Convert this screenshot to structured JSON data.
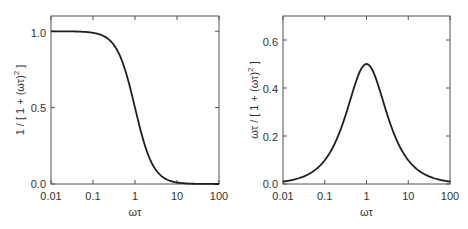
{
  "chart_data": [
    {
      "type": "line",
      "title": "",
      "xlabel": "ωτ",
      "ylabel": "1 / [ 1 + (ωτ)² ]",
      "xscale": "log",
      "xlim": [
        0.01,
        100
      ],
      "ylim": [
        0,
        1.1
      ],
      "xticks": [
        0.01,
        0.1,
        1,
        10,
        100
      ],
      "xtick_labels": [
        "0.01",
        "0.1",
        "1",
        "10",
        "100"
      ],
      "yticks": [
        0.0,
        0.5,
        1.0
      ],
      "ytick_labels": [
        "0.0",
        "0.5",
        "1.0"
      ],
      "grid": false,
      "legend": null,
      "series": [
        {
          "name": "1/(1+(ωτ)^2)",
          "x": [
            0.01,
            0.03,
            0.1,
            0.2,
            0.3,
            0.5,
            0.7,
            1,
            1.5,
            2,
            3,
            5,
            10,
            30,
            100
          ],
          "values": [
            1.0,
            0.999,
            0.99,
            0.962,
            0.917,
            0.8,
            0.671,
            0.5,
            0.308,
            0.2,
            0.1,
            0.038,
            0.01,
            0.001,
            0.0001
          ]
        }
      ]
    },
    {
      "type": "line",
      "title": "",
      "xlabel": "ωτ",
      "ylabel": "ωτ / [ 1 + (ωτ)² ]",
      "xscale": "log",
      "xlim": [
        0.01,
        100
      ],
      "ylim": [
        0,
        0.7
      ],
      "xticks": [
        0.01,
        0.1,
        1,
        10,
        100
      ],
      "xtick_labels": [
        "0.01",
        "0.1",
        "1",
        "10",
        "100"
      ],
      "yticks": [
        0.0,
        0.2,
        0.4,
        0.6
      ],
      "ytick_labels": [
        "0.0",
        "0.2",
        "0.4",
        "0.6"
      ],
      "grid": false,
      "legend": null,
      "series": [
        {
          "name": "ωτ/(1+(ωτ)^2)",
          "x": [
            0.01,
            0.03,
            0.1,
            0.2,
            0.3,
            0.5,
            0.7,
            1,
            1.5,
            2,
            3,
            5,
            10,
            30,
            100
          ],
          "values": [
            0.01,
            0.03,
            0.099,
            0.192,
            0.275,
            0.4,
            0.47,
            0.5,
            0.462,
            0.4,
            0.3,
            0.192,
            0.099,
            0.033,
            0.01
          ]
        }
      ]
    }
  ],
  "plots": [
    {
      "ylabel_main": "1 / [ 1 + (ωτ)",
      "ylabel_sup": "2",
      "ylabel_tail": " ]",
      "xlabel": "ωτ",
      "xtick_labels": [
        "0.01",
        "0.1",
        "1",
        "10",
        "100"
      ],
      "ytick_labels": [
        "0.0",
        "0.5",
        "1.0"
      ]
    },
    {
      "ylabel_main": "ωτ / [ 1 + (ωτ)",
      "ylabel_sup": "2",
      "ylabel_tail": " ]",
      "xlabel": "ωτ",
      "xtick_labels": [
        "0.01",
        "0.1",
        "1",
        "10",
        "100"
      ],
      "ytick_labels": [
        "0.0",
        "0.2",
        "0.4",
        "0.6"
      ]
    }
  ]
}
